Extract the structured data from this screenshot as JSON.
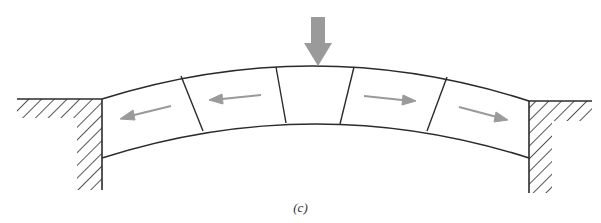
{
  "figure": {
    "caption": "(c)",
    "colors": {
      "line": "#2b2b2b",
      "arrow": "#9a9a9a",
      "hatch": "#2b2b2b",
      "background": "#ffffff"
    },
    "elements": {
      "load_arrow": "downward-load-arrow",
      "blocks": 5,
      "thrust_arrows": [
        "left",
        "left",
        "right",
        "right"
      ],
      "abutments": [
        "left",
        "right"
      ]
    }
  }
}
